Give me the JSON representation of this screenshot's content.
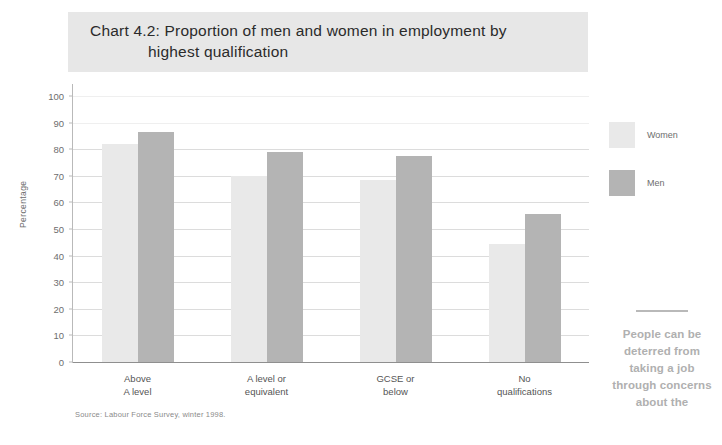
{
  "chart_data": {
    "type": "bar",
    "title": "Chart 4.2: Proportion of men and women in employment by highest qualification",
    "title_line1": "Chart 4.2: Proportion of men and women in employment by",
    "title_line2": "highest qualification",
    "xlabel": "",
    "ylabel": "Percentage",
    "ylim": [
      0,
      100
    ],
    "ytick_values": [
      0,
      10,
      20,
      30,
      40,
      50,
      60,
      70,
      80,
      90,
      100
    ],
    "ytick_labels": [
      "0",
      "10",
      "20",
      "30",
      "40",
      "50",
      "60",
      "70",
      "80",
      "90",
      "100"
    ],
    "grid": true,
    "legend_position": "right",
    "categories": [
      "Above\nA level",
      "A level or\nequivalent",
      "GCSE or\nbelow",
      "No\nqualifications"
    ],
    "series": [
      {
        "name": "Women",
        "color": "#e9e9e9",
        "values": [
          82,
          70,
          68.5,
          44.5
        ]
      },
      {
        "name": "Men",
        "color": "#b4b4b4",
        "values": [
          86.5,
          79,
          77.5,
          55.5
        ]
      }
    ],
    "source": "Source: Labour Force Survey, winter 1998."
  },
  "legend": {
    "entries": [
      {
        "label": "Women",
        "swatch": "women"
      },
      {
        "label": "Men",
        "swatch": "men"
      }
    ]
  },
  "pullquote": {
    "text": "People can be deterred from taking a job through concerns about the"
  },
  "colors": {
    "title_band": "#e7e7e7",
    "women_bar": "#e9e9e9",
    "men_bar": "#b4b4b4",
    "gridline": "#dcdcdc",
    "axis": "#8f8f8f",
    "pullquote_text": "#b0b0b0"
  }
}
